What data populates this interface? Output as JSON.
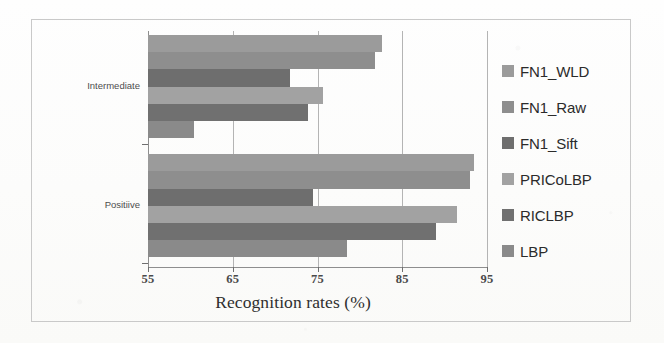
{
  "figure": {
    "x_axis_title": "Recognition rates (%)"
  },
  "legend": {
    "items": [
      {
        "label": "FN1_WLD",
        "color": "#9b9b9b",
        "swatch_icon": "legend-swatch-icon"
      },
      {
        "label": "FN1_Raw",
        "color": "#8e8e8e",
        "swatch_icon": "legend-swatch-icon"
      },
      {
        "label": "FN1_Sift",
        "color": "#6e6e6e",
        "swatch_icon": "legend-swatch-icon"
      },
      {
        "label": "PRICoLBP",
        "color": "#a2a2a2",
        "swatch_icon": "legend-swatch-icon"
      },
      {
        "label": "RICLBP",
        "color": "#707070",
        "swatch_icon": "legend-swatch-icon"
      },
      {
        "label": "LBP",
        "color": "#8a8a8a",
        "swatch_icon": "legend-swatch-icon"
      }
    ]
  },
  "chart_data": {
    "type": "bar",
    "orientation": "horizontal",
    "title": "",
    "subtitle": "",
    "xlabel": "Recognition rates (%)",
    "ylabel": "",
    "xlim": [
      55,
      95
    ],
    "xticks": [
      55,
      65,
      75,
      85,
      95
    ],
    "xtick_labels": [
      "55",
      "65",
      "75",
      "85",
      "95"
    ],
    "grid": true,
    "grid_axis": "x",
    "legend_position": "right",
    "categories": [
      "Intermediate",
      "Positiive"
    ],
    "series": [
      {
        "name": "FN1_WLD",
        "color": "#9b9b9b",
        "values": [
          82.6,
          93.5
        ]
      },
      {
        "name": "FN1_Raw",
        "color": "#8e8e8e",
        "values": [
          81.8,
          93.0
        ]
      },
      {
        "name": "FN1_Sift",
        "color": "#6e6e6e",
        "values": [
          71.8,
          74.5
        ]
      },
      {
        "name": "PRICoLBP",
        "color": "#a2a2a2",
        "values": [
          75.6,
          91.5
        ]
      },
      {
        "name": "RICLBP",
        "color": "#707070",
        "values": [
          73.9,
          89.0
        ]
      },
      {
        "name": "LBP",
        "color": "#8a8a8a",
        "values": [
          60.4,
          78.5
        ]
      }
    ]
  }
}
